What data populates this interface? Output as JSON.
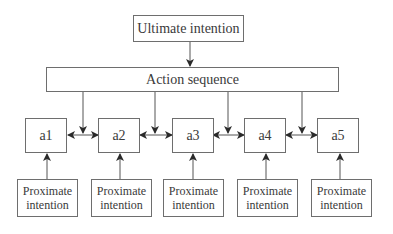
{
  "diagram": {
    "ultimate": {
      "label": "Ultimate intention"
    },
    "action": {
      "label": "Action sequence"
    },
    "actions": [
      {
        "label": "a1",
        "x": 25
      },
      {
        "label": "a2",
        "x": 98
      },
      {
        "label": "a3",
        "x": 172
      },
      {
        "label": "a4",
        "x": 244
      },
      {
        "label": "a5",
        "x": 317
      }
    ],
    "proximate": [
      {
        "line1": "Proximate",
        "line2": "intention",
        "x": 17
      },
      {
        "line1": "Proximate",
        "line2": "intention",
        "x": 91
      },
      {
        "line1": "Proximate",
        "line2": "intention",
        "x": 163
      },
      {
        "line1": "Proximate",
        "line2": "intention",
        "x": 237
      },
      {
        "line1": "Proximate",
        "line2": "intention",
        "x": 311
      }
    ],
    "colors": {
      "line": "#3a3a3a",
      "border": "#6e6e6e"
    }
  }
}
